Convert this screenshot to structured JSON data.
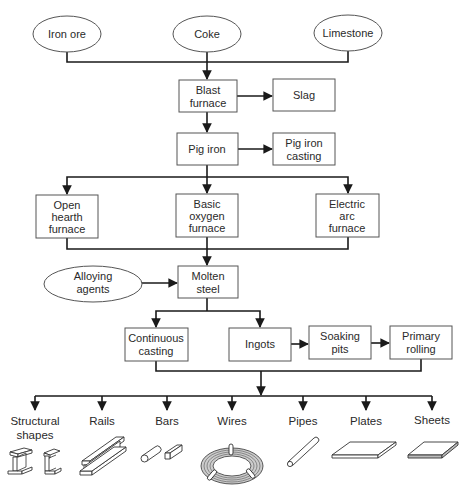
{
  "diagram": {
    "colors": {
      "line": "#1a1a1a",
      "box_stroke": "#555555",
      "text": "#2a2a2a",
      "background": "#ffffff"
    },
    "raw_materials": [
      {
        "id": "iron_ore",
        "label": "Iron ore",
        "shape": "ellipse"
      },
      {
        "id": "coke",
        "label": "Coke",
        "shape": "ellipse"
      },
      {
        "id": "limestone",
        "label": "Limestone",
        "shape": "ellipse"
      }
    ],
    "nodes": {
      "blast_furnace": {
        "line1": "Blast",
        "line2": "furnace"
      },
      "slag": {
        "line1": "Slag"
      },
      "pig_iron": {
        "line1": "Pig iron"
      },
      "pig_iron_casting": {
        "line1": "Pig iron",
        "line2": "casting"
      },
      "open_hearth": {
        "line1": "Open",
        "line2": "hearth",
        "line3": "furnace"
      },
      "basic_oxygen": {
        "line1": "Basic",
        "line2": "oxygen",
        "line3": "furnace"
      },
      "electric_arc": {
        "line1": "Electric",
        "line2": "arc",
        "line3": "furnace"
      },
      "alloying_agents": {
        "line1": "Alloying",
        "line2": "agents",
        "shape": "ellipse"
      },
      "molten_steel": {
        "line1": "Molten",
        "line2": "steel"
      },
      "continuous_casting": {
        "line1": "Continuous",
        "line2": "casting"
      },
      "ingots": {
        "line1": "Ingots"
      },
      "soaking_pits": {
        "line1": "Soaking",
        "line2": "pits"
      },
      "primary_rolling": {
        "line1": "Primary",
        "line2": "rolling"
      }
    },
    "products": [
      {
        "id": "structural_shapes",
        "line1": "Structural",
        "line2": "shapes",
        "icon": "i-beam-and-channel-icon"
      },
      {
        "id": "rails",
        "line1": "Rails",
        "icon": "rail-icon"
      },
      {
        "id": "bars",
        "line1": "Bars",
        "icon": "round-and-square-bar-icon"
      },
      {
        "id": "wires",
        "line1": "Wires",
        "icon": "wire-coil-icon"
      },
      {
        "id": "pipes",
        "line1": "Pipes",
        "icon": "pipe-icon"
      },
      {
        "id": "plates",
        "line1": "Plates",
        "icon": "plate-icon"
      },
      {
        "id": "sheets",
        "line1": "Sheets",
        "icon": "sheet-icon"
      }
    ],
    "edges": [
      [
        "Iron ore",
        "Blast furnace"
      ],
      [
        "Coke",
        "Blast furnace"
      ],
      [
        "Limestone",
        "Blast furnace"
      ],
      [
        "Blast furnace",
        "Slag"
      ],
      [
        "Blast furnace",
        "Pig iron"
      ],
      [
        "Pig iron",
        "Pig iron casting"
      ],
      [
        "Pig iron",
        "Open hearth furnace"
      ],
      [
        "Pig iron",
        "Basic oxygen furnace"
      ],
      [
        "Pig iron",
        "Electric arc furnace"
      ],
      [
        "Open hearth furnace",
        "Molten steel"
      ],
      [
        "Basic oxygen furnace",
        "Molten steel"
      ],
      [
        "Electric arc furnace",
        "Molten steel"
      ],
      [
        "Alloying agents",
        "Molten steel"
      ],
      [
        "Molten steel",
        "Continuous casting"
      ],
      [
        "Molten steel",
        "Ingots"
      ],
      [
        "Ingots",
        "Soaking pits"
      ],
      [
        "Soaking pits",
        "Primary rolling"
      ],
      [
        "Continuous casting",
        "Products"
      ],
      [
        "Primary rolling",
        "Products"
      ]
    ]
  }
}
